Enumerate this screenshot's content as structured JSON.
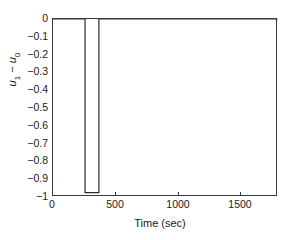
{
  "chart_data": {
    "type": "line",
    "title": "",
    "xlabel": "Time (sec)",
    "ylabel": "u_1 - u_0",
    "ylabel_parts": {
      "var1": "u",
      "sub1": "1",
      "minus": "−",
      "var2": "u",
      "sub2": "0"
    },
    "xlim": [
      0,
      1790
    ],
    "ylim": [
      -1,
      0
    ],
    "grid": false,
    "legend": null,
    "xticks": [
      0,
      500,
      1000,
      1500
    ],
    "xticklabels": [
      "0",
      "500",
      "1000",
      "1500"
    ],
    "yticks": [
      0,
      -0.1,
      -0.2,
      -0.3,
      -0.4,
      -0.5,
      -0.6,
      -0.7,
      -0.8,
      -0.9,
      -1
    ],
    "yticklabels": [
      "0",
      "−0.1",
      "−0.2",
      "−0.3",
      "−0.4",
      "−0.5",
      "−0.6",
      "−0.7",
      "−0.8",
      "−0.9",
      "−1"
    ],
    "series": [
      {
        "name": "u1 - u0",
        "color": "#2b2b2b",
        "linewidth": 1.2,
        "x": [
          0,
          255,
          255,
          365,
          365,
          1790
        ],
        "y": [
          0,
          0,
          -0.975,
          -0.975,
          0,
          0
        ]
      }
    ],
    "annotations": {
      "pulse_start_sec": 255,
      "pulse_end_sec": 365,
      "pulse_depth": -0.975,
      "baseline": 0
    }
  },
  "figure": {
    "background": "#ffffff",
    "axis_color": "#3a3a3a",
    "text_color": "#1a1a1a"
  }
}
